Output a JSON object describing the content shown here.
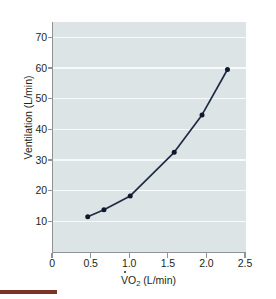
{
  "chart_data": {
    "type": "line",
    "title": "",
    "subtitle": "",
    "xlabel": "VO2 (L/min)",
    "xlabel_parts": {
      "v": "V",
      "dot": "˙",
      "o": "O",
      "sub": "2",
      "units": " (L/min)"
    },
    "ylabel": "Ventilation (L/min)",
    "xlim": [
      0,
      2.5
    ],
    "ylim": [
      0,
      75
    ],
    "xticks": [
      0,
      0.5,
      1.0,
      1.5,
      2.0,
      2.5
    ],
    "xtick_labels": [
      "0",
      "0.5",
      "1.0",
      "1.5",
      "2.0",
      "2.5"
    ],
    "yticks": [
      10,
      20,
      30,
      40,
      50,
      60,
      70
    ],
    "ytick_labels": [
      "10",
      "20",
      "30",
      "40",
      "50",
      "60",
      "70"
    ],
    "grid": "horizontal",
    "grid_color": "#f7fafb",
    "legend": "none",
    "plot_bgcolor": "#dde4e6",
    "line_color": "#1d2b44",
    "marker_color": "#10182b",
    "marker_shape": "circle",
    "x": [
      0.45,
      0.66,
      1.0,
      1.57,
      1.93,
      2.26
    ],
    "y": [
      11.5,
      13.8,
      18.3,
      32.5,
      44.7,
      59.5
    ],
    "series": [
      {
        "name": "Ventilation vs VO2",
        "points": [
          {
            "x": 0.45,
            "y": 11.5
          },
          {
            "x": 0.66,
            "y": 13.8
          },
          {
            "x": 1.0,
            "y": 18.3
          },
          {
            "x": 1.57,
            "y": 32.5
          },
          {
            "x": 1.93,
            "y": 44.7
          },
          {
            "x": 2.26,
            "y": 59.5
          }
        ]
      }
    ]
  },
  "accent": {
    "bar_color": "#7b3326"
  }
}
